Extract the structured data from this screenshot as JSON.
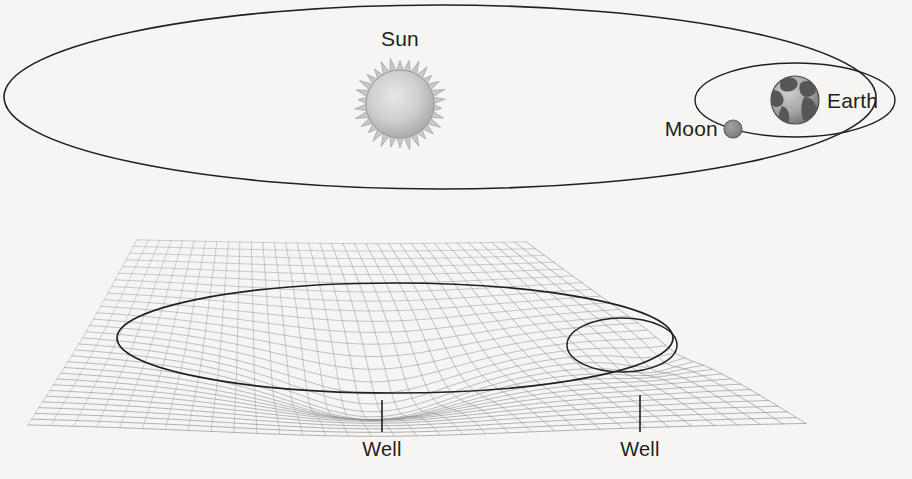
{
  "figure": {
    "kind": "diagram",
    "background_color": "#f6f5f3",
    "ink_color": "#231f20",
    "grid_color": "#8a8a8a"
  },
  "labels": {
    "sun": "Sun",
    "earth": "Earth",
    "moon": "Moon",
    "well_sun": "Well",
    "well_earth": "Well"
  },
  "top_panel": {
    "caption": "orbital view",
    "sun_orbit_ellipse": {
      "cx": 440,
      "cy": 97,
      "rx": 436,
      "ry": 92,
      "stroke": "#231f20",
      "stroke_width": 1.6,
      "fill": "none"
    },
    "moon_orbit_ellipse": {
      "cx": 795,
      "cy": 100,
      "rx": 100,
      "ry": 37,
      "stroke": "#231f20",
      "stroke_width": 1.4,
      "fill": "none"
    },
    "sun_body": {
      "cx": 400,
      "cy": 104,
      "r": 34,
      "ray_count": 30,
      "ray_length": 11,
      "fill_center": "#e2e1e0",
      "fill_edge": "#a9a8a7"
    },
    "earth_body": {
      "cx": 795,
      "cy": 100,
      "r": 24,
      "fill_ocean": "#b9b8b7",
      "fill_land": "#5d5c5b"
    },
    "moon_body": {
      "cx": 733,
      "cy": 129,
      "r": 9,
      "fill": "#8e8d8c"
    },
    "label_positions": {
      "sun": {
        "x": 400,
        "y": 46
      },
      "earth": {
        "x": 827,
        "y": 108
      },
      "moon": {
        "x": 718,
        "y": 136
      }
    }
  },
  "bottom_panel": {
    "caption": "warped spacetime sheet with two gravity wells",
    "sheet": {
      "u_lines": 34,
      "v_lines": 30,
      "left": 28,
      "right": 806,
      "top": 232,
      "bottom": 418,
      "stroke": "#8f8f8f",
      "stroke_width": 0.8
    },
    "sun_well": {
      "center_x": 372,
      "center_y": 338,
      "depth": 74,
      "radius": 155,
      "description": "deep broad funnel"
    },
    "earth_well": {
      "center_x": 650,
      "center_y": 340,
      "depth": 16,
      "radius": 58,
      "description": "shallow small funnel"
    },
    "earth_orbit_ellipse": {
      "cx": 395,
      "cy": 338,
      "rx": 278,
      "ry": 55,
      "stroke": "#231f20",
      "stroke_width": 1.7,
      "fill": "none"
    },
    "moon_orbit_ellipse": {
      "cx": 622,
      "cy": 345,
      "rx": 55,
      "ry": 27,
      "stroke": "#231f20",
      "stroke_width": 1.5,
      "fill": "none"
    },
    "leader_sun": {
      "x": 382,
      "y1": 400,
      "y2": 432
    },
    "leader_earth": {
      "x": 640,
      "y1": 395,
      "y2": 432
    },
    "label_positions": {
      "well_sun": {
        "x": 382,
        "y": 456
      },
      "well_earth": {
        "x": 640,
        "y": 456
      }
    }
  }
}
